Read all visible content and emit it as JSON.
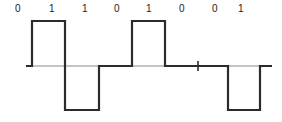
{
  "figure": {
    "name": "bipolar-ami-line-code-waveform",
    "background_color": "#ffffff",
    "width": 282,
    "height": 122
  },
  "labels": {
    "bits": [
      {
        "text": "0",
        "x": 18
      },
      {
        "text": "1",
        "x": 52
      },
      {
        "text": "1",
        "x": 85
      },
      {
        "text": "0",
        "x": 117
      },
      {
        "text": "1",
        "x": 149
      },
      {
        "text": "0",
        "x": 182
      },
      {
        "text": "0",
        "x": 215
      },
      {
        "text": "1",
        "x": 241
      }
    ],
    "color": "#1a1a1a",
    "font_size_px": 10
  },
  "chart_data": {
    "type": "line",
    "title": "",
    "xlabel": "",
    "ylabel": "",
    "encoding": "bipolar-AMI",
    "bit_sequence": [
      "0",
      "1",
      "1",
      "0",
      "1",
      "0",
      "0",
      "1"
    ],
    "levels": [
      "0",
      "+1",
      "-1",
      "0",
      "+1",
      "0",
      "0",
      "-1"
    ],
    "ylim": [
      -1,
      1
    ],
    "grid": false,
    "legend": null,
    "axis": {
      "baseline_y_px": 66,
      "high_y_px": 21,
      "low_y_px": 110,
      "x_start_px": 26,
      "x_end_px": 272,
      "bit_boundaries_px": [
        32,
        65,
        99,
        132,
        165,
        198,
        228,
        260
      ],
      "tick_half_height_px": 5
    },
    "stroke": {
      "signal_color": "#2b2b2b",
      "signal_width_px": 2.2,
      "baseline_color": "#8c8c8c",
      "baseline_width_px": 1.2
    },
    "series": [
      {
        "name": "line-signal",
        "points": [
          {
            "x": 26,
            "y": 0
          },
          {
            "x": 32,
            "y": 0
          },
          {
            "x": 32,
            "y": 1
          },
          {
            "x": 65,
            "y": 1
          },
          {
            "x": 65,
            "y": -1
          },
          {
            "x": 99,
            "y": -1
          },
          {
            "x": 99,
            "y": 0
          },
          {
            "x": 132,
            "y": 0
          },
          {
            "x": 132,
            "y": 1
          },
          {
            "x": 165,
            "y": 1
          },
          {
            "x": 165,
            "y": 0
          },
          {
            "x": 228,
            "y": 0
          },
          {
            "x": 228,
            "y": -1
          },
          {
            "x": 260,
            "y": -1
          },
          {
            "x": 260,
            "y": 0
          },
          {
            "x": 272,
            "y": 0
          }
        ]
      }
    ],
    "zero_ticks_px": [
      198
    ]
  }
}
